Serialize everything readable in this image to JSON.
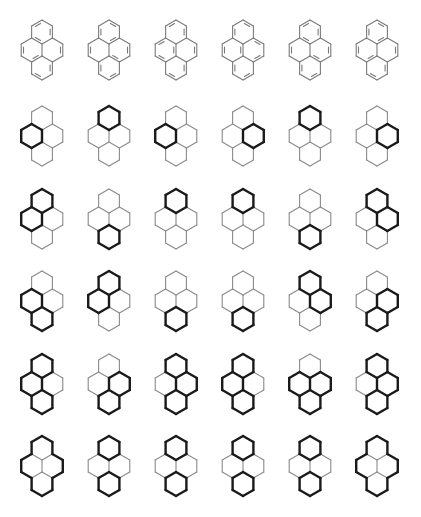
{
  "figure": {
    "rows": 6,
    "columns": 6,
    "column_centers_x": [
      42,
      109,
      176,
      243,
      310,
      377
    ],
    "row_centers_y": [
      50,
      136,
      219,
      301,
      384,
      466
    ],
    "colors": {
      "thin": "#8a8a8a",
      "bold": "#1a1a1a",
      "bond": "#7a7a7a",
      "background": "#ffffff"
    }
  },
  "kekule_row": {
    "description": "Six Kekule structures of pyrene (double bonds drawn as inner parallel lines)",
    "structures": [
      [
        "fa",
        "bc",
        "de",
        "ij",
        "gh",
        "kl",
        "mn",
        "op"
      ],
      [
        "ab",
        "cd",
        "ef",
        "ij",
        "mg",
        "ph",
        "kl",
        "no"
      ],
      [
        "fa",
        "bc",
        "dg",
        "je",
        "hi",
        "kl",
        "mn",
        "op"
      ],
      [
        "ab",
        "ck",
        "ef",
        "dg",
        "ij",
        "ph",
        "lm",
        "no"
      ],
      [
        "fa",
        "bc",
        "de",
        "ij",
        "mg",
        "ph",
        "kl",
        "no"
      ],
      [
        "ab",
        "cd",
        "ef",
        "ij",
        "gh",
        "kl",
        "mn",
        "op"
      ]
    ]
  },
  "ring_rows": [
    {
      "row": 2,
      "molecules": [
        [
          "L"
        ],
        [
          "T"
        ],
        [
          "L"
        ],
        [
          "R"
        ],
        [
          "T"
        ],
        [
          "R"
        ]
      ]
    },
    {
      "row": 3,
      "molecules": [
        [
          "T",
          "L"
        ],
        [
          "B"
        ],
        [
          "T"
        ],
        [
          "T"
        ],
        [
          "B"
        ],
        [
          "T",
          "R"
        ]
      ]
    },
    {
      "row": 4,
      "molecules": [
        [
          "L",
          "B"
        ],
        [
          "T",
          "L"
        ],
        [
          "B"
        ],
        [
          "B"
        ],
        [
          "T",
          "R"
        ],
        [
          "R",
          "B"
        ]
      ]
    },
    {
      "row": 5,
      "molecules": [
        [
          "T",
          "L",
          "B"
        ],
        [
          "R",
          "B"
        ],
        [
          "T",
          "R",
          "B"
        ],
        [
          "T",
          "L",
          "B"
        ],
        [
          "L",
          "R",
          "B"
        ],
        [
          "T",
          "R",
          "B"
        ]
      ]
    },
    {
      "row": 6,
      "molecules": [
        [
          "PERIMETER"
        ],
        [
          "T",
          "B"
        ],
        [
          "T",
          "B"
        ],
        [
          "T",
          "B"
        ],
        [
          "T",
          "B"
        ],
        [
          "PERIMETER"
        ]
      ]
    }
  ],
  "ring_legend": {
    "T": "top ring",
    "L": "middle-left ring",
    "R": "middle-right ring",
    "B": "bottom ring",
    "PERIMETER": "outer perimeter bold"
  }
}
